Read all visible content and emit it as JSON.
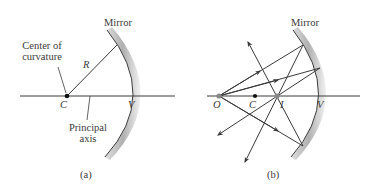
{
  "panel_a": {
    "mirror_label": "Mirror",
    "center_label_line1": "Center of",
    "center_label_line2": "curvature",
    "radius_label": "R",
    "c_label": "C",
    "v_label": "V",
    "axis_label_line1": "Principal",
    "axis_label_line2": "axis",
    "caption": "(a)"
  },
  "panel_b": {
    "mirror_label": "Mirror",
    "o_label": "O",
    "c_label": "C",
    "i_label": "I",
    "v_label": "V",
    "caption": "(b)"
  },
  "colors": {
    "line": "#3a3a3a",
    "mirror_shade": "#b8b8b8",
    "point": "#111111",
    "object_point": "#888888"
  }
}
